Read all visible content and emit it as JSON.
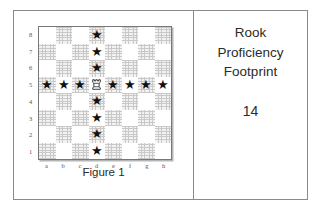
{
  "figure": {
    "caption": "Figure 1",
    "board": {
      "rank_labels": [
        "8",
        "7",
        "6",
        "5",
        "4",
        "3",
        "2",
        "1"
      ],
      "file_labels": [
        "a",
        "b",
        "c",
        "d",
        "e",
        "f",
        "g",
        "h"
      ],
      "piece": {
        "type": "rook",
        "color": "white",
        "square": "d5",
        "icon": "white-rook-icon"
      },
      "marker_glyph": "★",
      "marker_squares": [
        "d8",
        "d7",
        "d6",
        "a5",
        "b5",
        "c5",
        "e5",
        "f5",
        "g5",
        "h5",
        "d4",
        "d3",
        "d2",
        "d1"
      ],
      "marker_count": 14,
      "light_square_color": "#ffffff",
      "dark_square_color": "#e3e3e3"
    }
  },
  "panel": {
    "title_lines": [
      "Rook",
      "Proficiency",
      "Footprint"
    ],
    "value": "14"
  },
  "chart_data": {
    "type": "heatmap",
    "xlabel": "",
    "ylabel": "",
    "x": [
      "a",
      "b",
      "c",
      "d",
      "e",
      "f",
      "g",
      "h"
    ],
    "y": [
      "8",
      "7",
      "6",
      "5",
      "4",
      "3",
      "2",
      "1"
    ],
    "legend": [
      "★ = attacked square",
      "♖ = white rook on d5"
    ],
    "annotations": [
      "Figure 1",
      "14"
    ],
    "grid": true,
    "values": [
      [
        0,
        0,
        0,
        1,
        0,
        0,
        0,
        0
      ],
      [
        0,
        0,
        0,
        1,
        0,
        0,
        0,
        0
      ],
      [
        0,
        0,
        0,
        1,
        0,
        0,
        0,
        0
      ],
      [
        1,
        1,
        1,
        2,
        1,
        1,
        1,
        1
      ],
      [
        0,
        0,
        0,
        1,
        0,
        0,
        0,
        0
      ],
      [
        0,
        0,
        0,
        1,
        0,
        0,
        0,
        0
      ],
      [
        0,
        0,
        0,
        1,
        0,
        0,
        0,
        0
      ],
      [
        0,
        0,
        0,
        1,
        0,
        0,
        0,
        0
      ]
    ],
    "value_key": {
      "0": "empty",
      "1": "star",
      "2": "rook"
    },
    "total_marked": 14
  }
}
